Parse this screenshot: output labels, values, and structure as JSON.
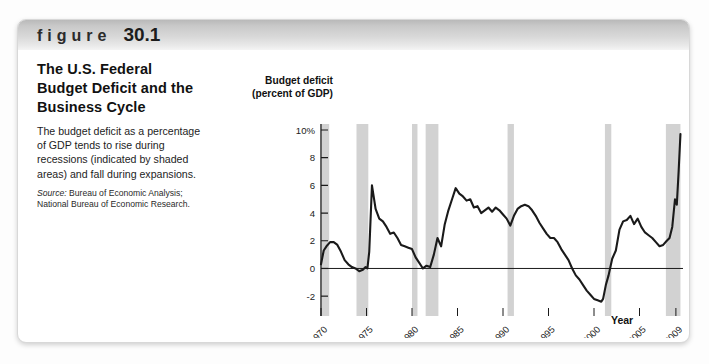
{
  "figure": {
    "word": "figure",
    "number": "30.1",
    "title": "The U.S. Federal Budget Deficit and the Business Cycle",
    "body": "The budget deficit as a percentage of GDP tends to rise during recessions (indicated by shaded areas) and fall during expansions.",
    "source_label": "Source:",
    "source_text": " Bureau of Economic Analysis; National Bureau of Economic Research."
  },
  "colors": {
    "header_band": "#d8d8d8",
    "recession_band": "#d2d2d2",
    "line": "#1a1a1a",
    "axis": "#1a1a1a",
    "card_border": "#d8d8d8"
  },
  "chart_data": {
    "type": "line",
    "title": "",
    "ylabel": "Budget deficit (percent of GDP)",
    "ylabel_line1": "Budget deficit",
    "ylabel_line2": "(percent of GDP)",
    "xlabel": "Year",
    "grid": false,
    "legend": "none",
    "xlim": [
      1970,
      2010
    ],
    "ylim": [
      -3,
      10
    ],
    "yticks": [
      10,
      8,
      6,
      4,
      2,
      0,
      -2
    ],
    "ytick_labels": [
      "10%",
      "8",
      "6",
      "4",
      "2",
      "0",
      "-2"
    ],
    "xticks": [
      1970,
      1975,
      1980,
      1985,
      1990,
      1995,
      2000,
      2005,
      2009
    ],
    "xtick_labels": [
      "1970",
      "1975",
      "1980",
      "1985",
      "1990",
      "1995",
      "2000",
      "2005",
      "2009"
    ],
    "zero_line": 0,
    "recession_bands": [
      {
        "start": 1969.9,
        "end": 1970.9
      },
      {
        "start": 1973.9,
        "end": 1975.2
      },
      {
        "start": 1980.0,
        "end": 1980.6
      },
      {
        "start": 1981.5,
        "end": 1982.9
      },
      {
        "start": 1990.5,
        "end": 1991.2
      },
      {
        "start": 2001.2,
        "end": 2001.9
      },
      {
        "start": 2007.9,
        "end": 2009.5
      }
    ],
    "series": [
      {
        "name": "Federal budget deficit (percent of GDP)",
        "x": [
          1970.0,
          1970.3,
          1970.6,
          1971.0,
          1971.4,
          1971.8,
          1972.2,
          1972.6,
          1973.0,
          1973.4,
          1973.8,
          1974.2,
          1974.6,
          1974.9,
          1975.1,
          1975.3,
          1975.6,
          1976.0,
          1976.4,
          1976.8,
          1977.2,
          1977.6,
          1978.0,
          1978.4,
          1978.8,
          1979.2,
          1979.6,
          1980.0,
          1980.4,
          1980.8,
          1981.2,
          1981.6,
          1982.0,
          1982.4,
          1982.8,
          1983.2,
          1983.6,
          1984.0,
          1984.4,
          1984.8,
          1985.2,
          1985.6,
          1986.0,
          1986.4,
          1986.8,
          1987.2,
          1987.6,
          1988.0,
          1988.4,
          1988.8,
          1989.2,
          1989.6,
          1990.0,
          1990.4,
          1990.8,
          1991.2,
          1991.6,
          1992.0,
          1992.4,
          1992.8,
          1993.2,
          1993.6,
          1994.0,
          1994.4,
          1994.8,
          1995.2,
          1995.6,
          1996.0,
          1996.4,
          1996.8,
          1997.2,
          1997.6,
          1998.0,
          1998.4,
          1998.8,
          1999.2,
          1999.6,
          2000.0,
          2000.4,
          2000.8,
          2001.0,
          2001.3,
          2001.6,
          2002.0,
          2002.4,
          2002.8,
          2003.2,
          2003.6,
          2004.0,
          2004.4,
          2004.8,
          2005.2,
          2005.6,
          2006.0,
          2006.4,
          2006.8,
          2007.2,
          2007.6,
          2008.0,
          2008.3,
          2008.6,
          2008.9,
          2009.1,
          2009.3,
          2009.5
        ],
        "y": [
          0.3,
          1.3,
          1.6,
          1.9,
          1.9,
          1.7,
          1.2,
          0.6,
          0.3,
          0.1,
          0.0,
          -0.2,
          -0.1,
          0.1,
          0.0,
          1.2,
          6.0,
          4.3,
          3.6,
          3.4,
          3.0,
          2.5,
          2.6,
          2.2,
          1.7,
          1.6,
          1.5,
          1.4,
          0.8,
          0.4,
          0.0,
          0.2,
          0.1,
          1.0,
          2.2,
          1.6,
          3.2,
          4.2,
          5.0,
          5.8,
          5.4,
          5.2,
          4.9,
          5.0,
          4.4,
          4.5,
          4.0,
          4.2,
          4.4,
          4.1,
          4.4,
          4.2,
          3.9,
          3.6,
          3.1,
          3.8,
          4.3,
          4.5,
          4.6,
          4.5,
          4.2,
          3.8,
          3.3,
          2.9,
          2.5,
          2.2,
          2.2,
          1.9,
          1.4,
          1.0,
          0.6,
          0.0,
          -0.5,
          -0.8,
          -1.2,
          -1.6,
          -1.9,
          -2.2,
          -2.3,
          -2.4,
          -2.2,
          -1.2,
          -0.5,
          0.7,
          1.3,
          2.8,
          3.4,
          3.5,
          3.8,
          3.2,
          3.6,
          3.0,
          2.6,
          2.4,
          2.2,
          1.9,
          1.6,
          1.7,
          2.0,
          2.2,
          3.0,
          5.0,
          4.6,
          7.0,
          9.7
        ]
      }
    ],
    "annotations": []
  }
}
